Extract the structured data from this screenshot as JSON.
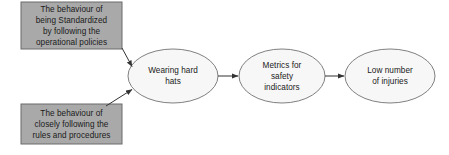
{
  "diagram": {
    "type": "flowchart",
    "background_color": "#ffffff",
    "boxes": [
      {
        "id": "standardization-box",
        "name": "box-being-standardized",
        "text": "The behaviour of\nbeing Standardized\nby following the\noperational policies",
        "shape": "rectangle",
        "fill": "#a9a9a9",
        "stroke": "#6b6b6b",
        "x": 21,
        "y": 2,
        "w": 101,
        "h": 47
      },
      {
        "id": "rules-box",
        "name": "box-closely-following-rules",
        "text": "The behaviour of\nclosely following the\nrules and procedures",
        "shape": "rectangle",
        "fill": "#a9a9a9",
        "stroke": "#6b6b6b",
        "x": 21,
        "y": 104,
        "w": 101,
        "h": 40
      }
    ],
    "ellipses": [
      {
        "id": "hard-hats",
        "name": "ellipse-wearing-hard-hats",
        "text": "Wearing hard\nhats",
        "shape": "ellipse",
        "fill": "#f7f7f7",
        "stroke": "#808080",
        "cx": 173,
        "cy": 76,
        "rx": 45,
        "ry": 27
      },
      {
        "id": "safety-metrics",
        "name": "ellipse-metrics-for-safety-indicators",
        "text": "Metrics for\nsafety\nindicators",
        "shape": "ellipse",
        "fill": "#f7f7f7",
        "stroke": "#808080",
        "cx": 282,
        "cy": 76,
        "rx": 43,
        "ry": 27
      },
      {
        "id": "low-injuries",
        "name": "ellipse-low-number-of-injuries",
        "text": "Low number\nof injuries",
        "shape": "ellipse",
        "fill": "#f7f7f7",
        "stroke": "#808080",
        "cx": 390,
        "cy": 76,
        "rx": 45,
        "ry": 27
      }
    ],
    "arrows": [
      {
        "id": "arrow-standardization-to-hats",
        "name": "arrow-standardization-to-hard-hats",
        "from": "standardization-box",
        "to": "hard-hats",
        "x1": 122,
        "y1": 48,
        "x2": 133,
        "y2": 67,
        "color": "#333333"
      },
      {
        "id": "arrow-rules-to-hats",
        "name": "arrow-rules-to-hard-hats",
        "from": "rules-box",
        "to": "hard-hats",
        "x1": 106,
        "y1": 106,
        "x2": 133,
        "y2": 89,
        "color": "#333333"
      },
      {
        "id": "arrow-hats-to-metrics",
        "name": "arrow-hard-hats-to-metrics",
        "from": "hard-hats",
        "to": "safety-metrics",
        "x1": 218,
        "y1": 76,
        "x2": 239,
        "y2": 76,
        "color": "#333333"
      },
      {
        "id": "arrow-metrics-to-injuries",
        "name": "arrow-metrics-to-low-injuries",
        "from": "safety-metrics",
        "to": "low-injuries",
        "x1": 325,
        "y1": 76,
        "x2": 344,
        "y2": 76,
        "color": "#333333"
      }
    ]
  }
}
